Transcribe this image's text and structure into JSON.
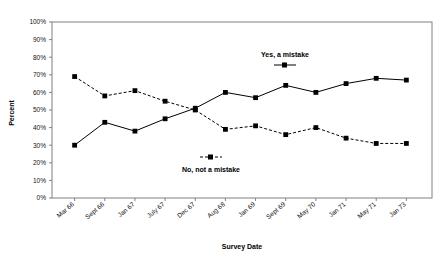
{
  "chart_data": {
    "type": "line",
    "title": "",
    "xlabel": "Survey Date",
    "ylabel": "Percent",
    "categories": [
      "Mar 66",
      "Sept 66",
      "Jan 67",
      "July 67",
      "Dec 67",
      "Aug 68",
      "Jan 69",
      "Sept 69",
      "May 70",
      "Jan 71",
      "May 71",
      "Jan 73"
    ],
    "ylim": [
      0,
      100
    ],
    "ytick_labels": [
      "0%",
      "10%",
      "20%",
      "30%",
      "40%",
      "50%",
      "60%",
      "70%",
      "80%",
      "90%",
      "100%"
    ],
    "ytick_values": [
      0,
      10,
      20,
      30,
      40,
      50,
      60,
      70,
      80,
      90,
      100
    ],
    "grid": false,
    "legend_position": "inside",
    "series": [
      {
        "name": "Yes, a mistake",
        "line_style": "solid",
        "marker": "square",
        "color": "#000000",
        "values": [
          30,
          43,
          38,
          45,
          51,
          60,
          57,
          64,
          60,
          65,
          68,
          67
        ]
      },
      {
        "name": "No, not a mistake",
        "line_style": "dashed",
        "marker": "square",
        "color": "#000000",
        "values": [
          69,
          58,
          61,
          55,
          50,
          39,
          41,
          36,
          40,
          34,
          31,
          31
        ]
      }
    ],
    "annotations": [
      {
        "text": "Yes, a mistake",
        "x_px": 285,
        "y_px": 57
      },
      {
        "text": "No, not a mistake",
        "x_px": 211,
        "y_px": 165
      }
    ]
  }
}
